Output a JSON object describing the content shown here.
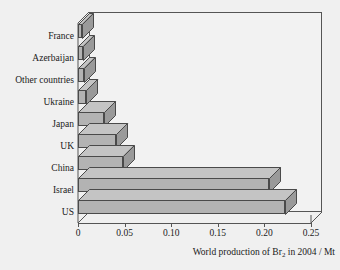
{
  "chart_data": {
    "type": "bar",
    "orientation": "horizontal",
    "title": "",
    "xlabel": "World production of Br2 in 2004 / Mt",
    "xlabel_parts": {
      "before": "World production of Br",
      "sub": "2",
      "after": " in 2004 / Mt"
    },
    "ylabel": "",
    "categories": [
      "France",
      "Azerbaijan",
      "Other countries",
      "Ukraine",
      "Japan",
      "UK",
      "China",
      "Israel",
      "US"
    ],
    "values": [
      0.004,
      0.005,
      0.006,
      0.009,
      0.028,
      0.041,
      0.048,
      0.205,
      0.222
    ],
    "xlim": [
      0,
      0.25
    ],
    "xticks": [
      0,
      0.05,
      0.1,
      0.15,
      0.2,
      0.25
    ],
    "xtick_labels": [
      "0",
      "0.05",
      "0.10",
      "0.15",
      "0.20",
      "0.25"
    ],
    "grid": false,
    "legend": null,
    "style": "3d-horizontal-bar",
    "colors": {
      "bar_front": "#b3b3b3",
      "bar_top": "#c4c4c4",
      "bar_side": "#9a9a9a",
      "bar_edge": "#4a4a4a",
      "plot_background": "#f2f2f2",
      "page_background": "#f0f0f0",
      "text": "#1a1a1a",
      "axis": "#555555"
    }
  }
}
